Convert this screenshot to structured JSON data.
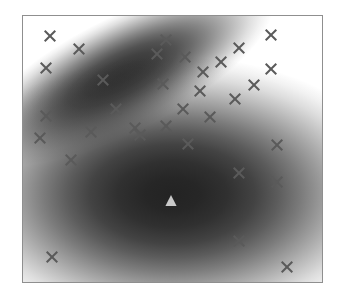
{
  "figure": {
    "title": "",
    "background_color": "#ffffff",
    "frame_color": "#8f8f8f",
    "frame_px": {
      "x": 22,
      "y": 15,
      "width": 301,
      "height": 268
    }
  },
  "chart_data": {
    "type": "scatter",
    "title": "",
    "subtitle": "",
    "xlabel": "",
    "ylabel": "",
    "xlim": [
      0,
      1
    ],
    "ylim": [
      0,
      1
    ],
    "grid": false,
    "legend_position": "none",
    "axis_ticks_visible": false,
    "tick_labels_x": [],
    "tick_labels_y": [],
    "annotations": [],
    "density_colormap": {
      "low_color": "#ffffff",
      "high_color": "#1a1a1a",
      "description": "two-component gaussian mixture density shaded white-to-black"
    },
    "density_components": [
      {
        "name": "component-1",
        "label": "upper-left elongated cluster",
        "center": [
          0.33,
          0.78
        ],
        "sigma_major": 0.215,
        "sigma_minor": 0.082,
        "rotation_deg": -27,
        "peak_intensity": 0.88,
        "weight": 0.34
      },
      {
        "name": "component-2",
        "label": "lower-center broad cluster",
        "center": [
          0.5,
          0.33
        ],
        "sigma_major": 0.295,
        "sigma_minor": 0.2,
        "rotation_deg": 0,
        "peak_intensity": 0.96,
        "weight": 0.66
      }
    ],
    "series": [
      {
        "name": "data-points",
        "marker": "x",
        "marker_color": "#5a5a5a",
        "marker_size_px": 13,
        "marker_stroke_px": 2,
        "count": 33,
        "points": [
          [
            0.09,
            0.925
          ],
          [
            0.186,
            0.876
          ],
          [
            0.077,
            0.806
          ],
          [
            0.478,
            0.91
          ],
          [
            0.542,
            0.847
          ],
          [
            0.601,
            0.79
          ],
          [
            0.468,
            0.746
          ],
          [
            0.721,
            0.878
          ],
          [
            0.829,
            0.929
          ],
          [
            0.661,
            0.828
          ],
          [
            0.831,
            0.799
          ],
          [
            0.591,
            0.718
          ],
          [
            0.774,
            0.739
          ],
          [
            0.708,
            0.688
          ],
          [
            0.076,
            0.624
          ],
          [
            0.312,
            0.652
          ],
          [
            0.535,
            0.649
          ],
          [
            0.478,
            0.586
          ],
          [
            0.625,
            0.62
          ],
          [
            0.376,
            0.578
          ],
          [
            0.552,
            0.519
          ],
          [
            0.056,
            0.541
          ],
          [
            0.229,
            0.563
          ],
          [
            0.39,
            0.552
          ],
          [
            0.16,
            0.458
          ],
          [
            0.851,
            0.514
          ],
          [
            0.721,
            0.411
          ],
          [
            0.85,
            0.376
          ],
          [
            0.096,
            0.094
          ],
          [
            0.721,
            0.154
          ],
          [
            0.884,
            0.057
          ],
          [
            0.448,
            0.858
          ],
          [
            0.268,
            0.758
          ]
        ]
      },
      {
        "name": "cluster-center",
        "marker": "triangle",
        "marker_color": "#c9c9c9",
        "marker_size_px": 13,
        "count": 1,
        "points": [
          [
            0.496,
            0.31
          ]
        ]
      }
    ]
  },
  "markers": {
    "x_glyph_name": "x-marker-icon",
    "triangle_glyph_name": "triangle-marker-icon"
  }
}
